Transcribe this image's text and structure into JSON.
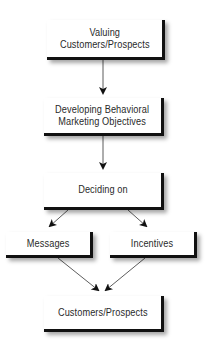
{
  "diagram": {
    "nodes": [
      {
        "id": "valuing",
        "label": "Valuing\nCustomers/Prospects"
      },
      {
        "id": "objectives",
        "label": "Developing Behavioral\nMarketing Objectives"
      },
      {
        "id": "deciding",
        "label": "Deciding on"
      },
      {
        "id": "messages",
        "label": "Messages"
      },
      {
        "id": "incentives",
        "label": "Incentives"
      },
      {
        "id": "customers",
        "label": "Customers/Prospects"
      }
    ],
    "edges": [
      {
        "from": "valuing",
        "to": "objectives"
      },
      {
        "from": "objectives",
        "to": "deciding"
      },
      {
        "from": "deciding",
        "to": "messages"
      },
      {
        "from": "deciding",
        "to": "incentives"
      },
      {
        "from": "messages",
        "to": "customers"
      },
      {
        "from": "incentives",
        "to": "customers"
      }
    ],
    "colors": {
      "box_border": "#111111",
      "arrow": "#222222",
      "text": "#2a2a2a"
    }
  }
}
